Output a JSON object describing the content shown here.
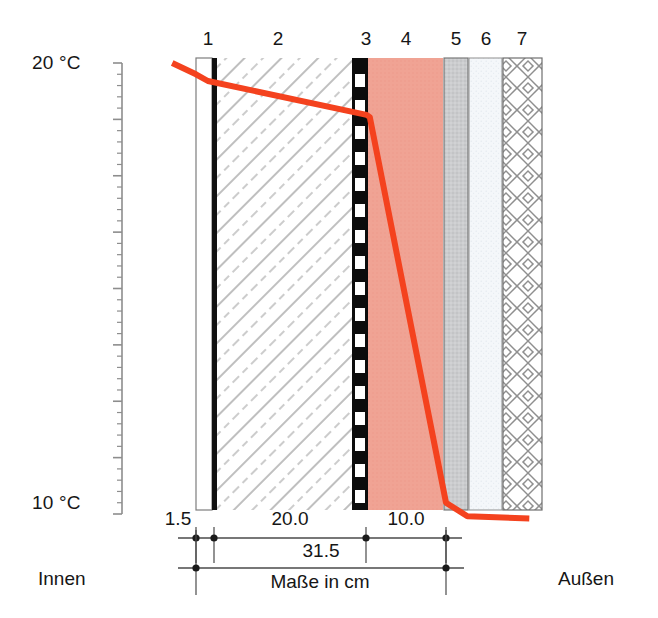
{
  "axis": {
    "top_label": "20 °C",
    "bottom_label": "10 °C",
    "tick_count": 41,
    "major_every": 5
  },
  "sides": {
    "inner_label": "Innen",
    "outer_label": "Außen"
  },
  "layer_numbers": [
    "1",
    "2",
    "3",
    "4",
    "5",
    "6",
    "7"
  ],
  "dimensions": {
    "seg1": "1.5",
    "seg2": "20.0",
    "seg3": "10.0",
    "total": "31.5",
    "unit_note": "Maße in cm"
  },
  "colors": {
    "curve": "#F4421E",
    "insulation": "#F0A394",
    "layer5_gray": "#C9CACC",
    "layer6_pale": "#F3F6F9",
    "ink": "#161616",
    "hatch": "#7a7a7a",
    "dim_line": "#4a4a4a"
  },
  "chart_data": {
    "type": "line",
    "title": "",
    "xlabel": "Maße in cm",
    "ylabel": "Temperatur",
    "ylim": [
      10,
      20
    ],
    "grid": false,
    "legend": "none",
    "series": [
      {
        "name": "Temperaturverlauf",
        "x_cm": [
          -3.0,
          0.0,
          1.5,
          21.5,
          21.9,
          31.5,
          34.2,
          42.0
        ],
        "y_degC": [
          20.0,
          19.75,
          19.6,
          18.85,
          18.8,
          10.25,
          9.95,
          9.9
        ]
      }
    ],
    "x_ticks_cm": [
      0.0,
      1.5,
      21.5,
      31.5
    ],
    "x_tick_labels": [
      "",
      "1.5",
      "20.0",
      "10.0"
    ],
    "y_ticks_degC": [
      10,
      20
    ],
    "y_tick_labels": [
      "10 °C",
      "20 °C"
    ],
    "layers": [
      {
        "num": "1",
        "name": "Innenputz",
        "thickness_cm": 1.5,
        "fill": "white"
      },
      {
        "num": "2",
        "name": "Mauerwerk",
        "thickness_cm": 20.0,
        "fill": "diagonal-hatch"
      },
      {
        "num": "3",
        "name": "Dampfsperre",
        "thickness_cm": 0.5,
        "fill": "black-dashed"
      },
      {
        "num": "4",
        "name": "Dämmung",
        "thickness_cm": 10.0,
        "fill": "#F0A394"
      },
      {
        "num": "5",
        "name": "Putztraeger",
        "thickness_cm": 1.5,
        "fill": "#C9CACC"
      },
      {
        "num": "6",
        "name": "Unterputz",
        "thickness_cm": 2.0,
        "fill": "#F3F6F9"
      },
      {
        "num": "7",
        "name": "Aussenputz",
        "thickness_cm": 2.5,
        "fill": "cross-hatch"
      }
    ]
  }
}
